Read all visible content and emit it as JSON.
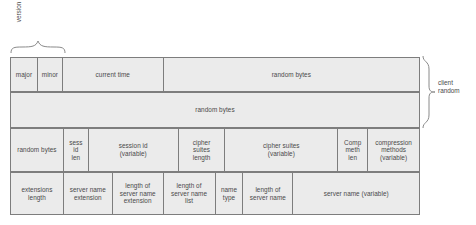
{
  "diagram": {
    "colors": {
      "cell_fill": "#ebebeb",
      "border": "#7d7d7d",
      "text": "#4a4a4a",
      "background": "#ffffff"
    },
    "annotations": {
      "version_label": "version",
      "client_random_label": "client\nrandom"
    },
    "rows": [
      {
        "name": "row-1",
        "cells": [
          {
            "label": "major",
            "width": 27
          },
          {
            "label": "minor",
            "width": 25
          },
          {
            "label": "current time",
            "width": 101
          },
          {
            "label": "random bytes",
            "width": 257
          }
        ]
      },
      {
        "name": "row-2",
        "cells": [
          {
            "label": "random bytes",
            "width": 410
          }
        ]
      },
      {
        "name": "row-3",
        "cells": [
          {
            "label": "random bytes",
            "width": 53
          },
          {
            "label": "sess\nid\nlen",
            "width": 25
          },
          {
            "label": "session id\n(variable)",
            "width": 90
          },
          {
            "label": "cipher\nsuites\nlength",
            "width": 47
          },
          {
            "label": "cipher suites\n(variable)",
            "width": 113
          },
          {
            "label": "Comp\nmeth\nlen",
            "width": 30
          },
          {
            "label": "compression\nmethods\n(variable)",
            "width": 52
          }
        ]
      },
      {
        "name": "row-4",
        "cells": [
          {
            "label": "extensions\nlength",
            "width": 53
          },
          {
            "label": "server name\nextension",
            "width": 49
          },
          {
            "label": "length of\nserver name\nextension",
            "width": 51
          },
          {
            "label": "length of\nserver name\nlist",
            "width": 52
          },
          {
            "label": "name\ntype",
            "width": 28
          },
          {
            "label": "length of\nserver name",
            "width": 50
          },
          {
            "label": "server name (variable)",
            "width": 127
          }
        ]
      }
    ]
  }
}
